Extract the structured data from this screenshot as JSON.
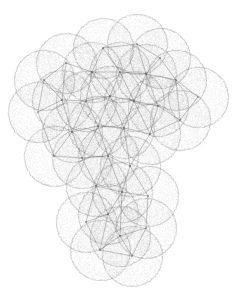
{
  "figure": {
    "type": "node-link-diagram-with-coverage-disks",
    "background_color": "#ffffff",
    "stipple_color": "#8c8c8c",
    "edge_color": "#555555",
    "disk_radius": 30,
    "canvas": {
      "width": 235,
      "height": 293
    },
    "bounds": {
      "x_min": 8,
      "y_min": 18,
      "x_max": 228,
      "y_max": 287
    },
    "caption": ""
  },
  "chart_data": {
    "type": "scatter",
    "xlabel": "",
    "ylabel": "",
    "xlim": [
      0,
      235
    ],
    "ylim": [
      0,
      293
    ],
    "grid": false,
    "legend": "none",
    "disk_radius": 30,
    "stipple_density": 0.55,
    "nodes": [
      {
        "id": 0,
        "x": 103,
        "y": 48
      },
      {
        "id": 1,
        "x": 137,
        "y": 44
      },
      {
        "id": 2,
        "x": 160,
        "y": 58
      },
      {
        "id": 3,
        "x": 176,
        "y": 80
      },
      {
        "id": 4,
        "x": 198,
        "y": 97
      },
      {
        "id": 5,
        "x": 146,
        "y": 74
      },
      {
        "id": 6,
        "x": 120,
        "y": 72
      },
      {
        "id": 7,
        "x": 92,
        "y": 72
      },
      {
        "id": 8,
        "x": 66,
        "y": 63
      },
      {
        "id": 9,
        "x": 44,
        "y": 80
      },
      {
        "id": 10,
        "x": 38,
        "y": 112
      },
      {
        "id": 11,
        "x": 62,
        "y": 100
      },
      {
        "id": 12,
        "x": 86,
        "y": 101
      },
      {
        "id": 13,
        "x": 110,
        "y": 96
      },
      {
        "id": 14,
        "x": 134,
        "y": 101
      },
      {
        "id": 15,
        "x": 158,
        "y": 106
      },
      {
        "id": 16,
        "x": 180,
        "y": 120
      },
      {
        "id": 17,
        "x": 150,
        "y": 134
      },
      {
        "id": 18,
        "x": 124,
        "y": 128
      },
      {
        "id": 19,
        "x": 98,
        "y": 126
      },
      {
        "id": 20,
        "x": 72,
        "y": 132
      },
      {
        "id": 21,
        "x": 54,
        "y": 156
      },
      {
        "id": 22,
        "x": 82,
        "y": 158
      },
      {
        "id": 23,
        "x": 108,
        "y": 156
      },
      {
        "id": 24,
        "x": 130,
        "y": 166
      },
      {
        "id": 25,
        "x": 96,
        "y": 186
      },
      {
        "id": 26,
        "x": 122,
        "y": 192
      },
      {
        "id": 27,
        "x": 148,
        "y": 196
      },
      {
        "id": 28,
        "x": 108,
        "y": 214
      },
      {
        "id": 29,
        "x": 86,
        "y": 222
      },
      {
        "id": 30,
        "x": 120,
        "y": 236
      },
      {
        "id": 31,
        "x": 146,
        "y": 228
      },
      {
        "id": 32,
        "x": 100,
        "y": 250
      },
      {
        "id": 33,
        "x": 132,
        "y": 256
      }
    ],
    "edges": [
      [
        0,
        1
      ],
      [
        0,
        6
      ],
      [
        0,
        7
      ],
      [
        1,
        2
      ],
      [
        1,
        5
      ],
      [
        2,
        3
      ],
      [
        2,
        5
      ],
      [
        3,
        4
      ],
      [
        3,
        5
      ],
      [
        3,
        16
      ],
      [
        4,
        16
      ],
      [
        5,
        6
      ],
      [
        5,
        14
      ],
      [
        5,
        15
      ],
      [
        6,
        7
      ],
      [
        6,
        13
      ],
      [
        6,
        14
      ],
      [
        7,
        8
      ],
      [
        7,
        12
      ],
      [
        7,
        13
      ],
      [
        8,
        9
      ],
      [
        8,
        11
      ],
      [
        9,
        10
      ],
      [
        9,
        11
      ],
      [
        10,
        11
      ],
      [
        10,
        21
      ],
      [
        11,
        12
      ],
      [
        11,
        20
      ],
      [
        12,
        13
      ],
      [
        12,
        19
      ],
      [
        12,
        20
      ],
      [
        13,
        14
      ],
      [
        13,
        18
      ],
      [
        13,
        19
      ],
      [
        14,
        15
      ],
      [
        14,
        17
      ],
      [
        14,
        18
      ],
      [
        15,
        16
      ],
      [
        15,
        17
      ],
      [
        16,
        17
      ],
      [
        17,
        18
      ],
      [
        17,
        24
      ],
      [
        18,
        19
      ],
      [
        18,
        23
      ],
      [
        18,
        24
      ],
      [
        19,
        20
      ],
      [
        19,
        22
      ],
      [
        19,
        23
      ],
      [
        20,
        21
      ],
      [
        20,
        22
      ],
      [
        21,
        22
      ],
      [
        22,
        23
      ],
      [
        22,
        25
      ],
      [
        23,
        24
      ],
      [
        23,
        25
      ],
      [
        23,
        26
      ],
      [
        24,
        26
      ],
      [
        24,
        27
      ],
      [
        25,
        26
      ],
      [
        25,
        28
      ],
      [
        25,
        29
      ],
      [
        26,
        27
      ],
      [
        26,
        28
      ],
      [
        26,
        30
      ],
      [
        27,
        31
      ],
      [
        28,
        29
      ],
      [
        28,
        30
      ],
      [
        28,
        32
      ],
      [
        29,
        32
      ],
      [
        30,
        31
      ],
      [
        30,
        32
      ],
      [
        30,
        33
      ],
      [
        31,
        33
      ],
      [
        32,
        33
      ]
    ]
  }
}
